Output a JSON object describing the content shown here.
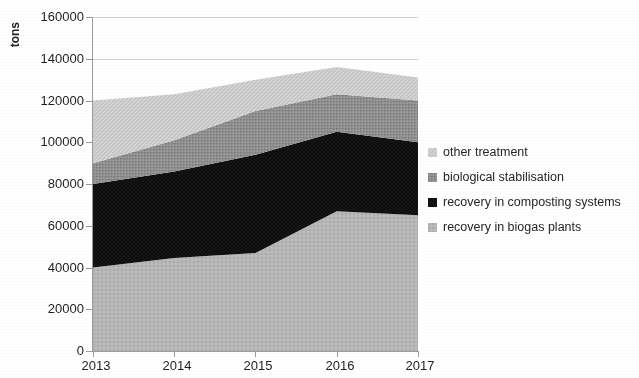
{
  "chart_data": {
    "type": "area",
    "title": "",
    "subtitle": "",
    "xlabel": "",
    "ylabel": "tons",
    "categories": [
      "2013",
      "2014",
      "2015",
      "2016",
      "2017"
    ],
    "x_tick_labels": [
      "2013",
      "2014",
      "2015",
      "2016",
      "2017"
    ],
    "y_tick_labels": [
      "0",
      "20000",
      "40000",
      "60000",
      "80000",
      "100000",
      "120000",
      "140000",
      "160000"
    ],
    "y_ticks": [
      0,
      20000,
      40000,
      60000,
      80000,
      100000,
      120000,
      140000,
      160000
    ],
    "ylim": [
      0,
      160000
    ],
    "grid": true,
    "grid_axis": "y",
    "stacked": true,
    "legend_position": "right",
    "series": [
      {
        "name": "recovery in biogas plants",
        "color": "#b2b2b2",
        "pattern": "dotted-light-gray",
        "values": [
          40000,
          44500,
          47000,
          67000,
          65000
        ]
      },
      {
        "name": "recovery in composting systems",
        "color": "#111111",
        "pattern": "solid-black",
        "values": [
          40000,
          41500,
          47000,
          38000,
          35000
        ]
      },
      {
        "name": "biological stabilisation",
        "color": "#8c8c8c",
        "pattern": "dense-mid-gray",
        "values": [
          10000,
          15000,
          21000,
          18000,
          20000
        ]
      },
      {
        "name": "other treatment",
        "color": "#cfcfcf",
        "pattern": "hatched-light-gray",
        "values": [
          30000,
          22000,
          15000,
          13000,
          11000
        ]
      }
    ],
    "cumulative_tops": {
      "recovery in biogas plants": [
        40000,
        44500,
        47000,
        67000,
        65000
      ],
      "recovery in composting systems": [
        80000,
        86000,
        94000,
        105000,
        100000
      ],
      "biological stabilisation": [
        90000,
        101000,
        115000,
        123000,
        120000
      ],
      "other treatment": [
        120000,
        123000,
        130000,
        136000,
        131000
      ]
    }
  },
  "legend": {
    "items": [
      {
        "label": "other treatment",
        "swatch_name": "legend-swatch-other-treatment"
      },
      {
        "label": "biological stabilisation",
        "swatch_name": "legend-swatch-biological-stabilisation"
      },
      {
        "label": "recovery in composting systems",
        "swatch_name": "legend-swatch-recovery-composting"
      },
      {
        "label": "recovery in biogas plants",
        "swatch_name": "legend-swatch-recovery-biogas"
      }
    ]
  }
}
